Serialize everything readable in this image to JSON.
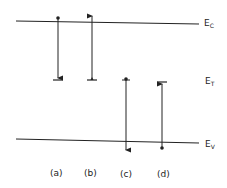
{
  "diagram": {
    "type": "energy-band transition diagram",
    "levels": [
      {
        "id": "Ec",
        "symbol": "E",
        "subscript": "C",
        "y": 22
      },
      {
        "id": "ET",
        "symbol": "E",
        "subscript": "T",
        "y": 80
      },
      {
        "id": "Ev",
        "symbol": "E",
        "subscript": "V",
        "y": 141
      }
    ],
    "transitions": [
      {
        "label": "(a)",
        "x": 58,
        "from": "Ec",
        "to": "ET",
        "direction": "down",
        "description": "electron capture"
      },
      {
        "label": "(b)",
        "x": 92,
        "from": "ET",
        "to": "Ec",
        "direction": "up",
        "description": "electron emission"
      },
      {
        "label": "(c)",
        "x": 126,
        "from": "ET",
        "to": "Ev",
        "direction": "down",
        "description": "hole capture"
      },
      {
        "label": "(d)",
        "x": 162,
        "from": "Ev",
        "to": "ET",
        "direction": "up",
        "description": "hole emission"
      }
    ],
    "colors": {
      "line": "#222222",
      "background": "#ffffff"
    }
  }
}
